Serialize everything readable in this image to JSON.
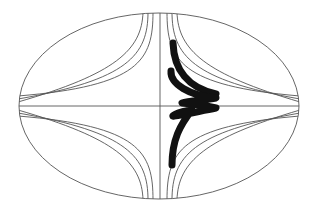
{
  "diagram": {
    "title": "",
    "colors": {
      "background": "#ffffff",
      "field_lines": "#555555",
      "trajectory": "#111111"
    },
    "ellipse": {
      "cx": 159,
      "cy": 106,
      "rx": 140,
      "ry": 93
    },
    "axes": {
      "horizontal": {
        "y": 106,
        "x1": 19,
        "x2": 299
      },
      "vertical": {
        "x": 160,
        "y1": 13,
        "y2": 199
      }
    },
    "field_lines_per_quadrant": 3,
    "quadrants": [
      "upper-left",
      "upper-right",
      "lower-left",
      "lower-right"
    ],
    "trajectory": {
      "label": "",
      "style": "bold",
      "segments": 5
    }
  }
}
